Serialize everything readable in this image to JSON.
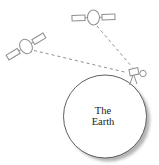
{
  "diagram": {
    "name": "gps-satellites-earth-diagram",
    "earth": {
      "label_line1": "The",
      "label_line2": "Earth"
    },
    "colors": {
      "background": "#ffffff",
      "outline_gray": "#8f8f8f",
      "earth_stroke": "#5f5f5f",
      "earth_fill": "#ffffff",
      "shadow": "#b4b4b4",
      "text": "#222222"
    },
    "line_style": {
      "signal_dash": "3,3"
    }
  }
}
